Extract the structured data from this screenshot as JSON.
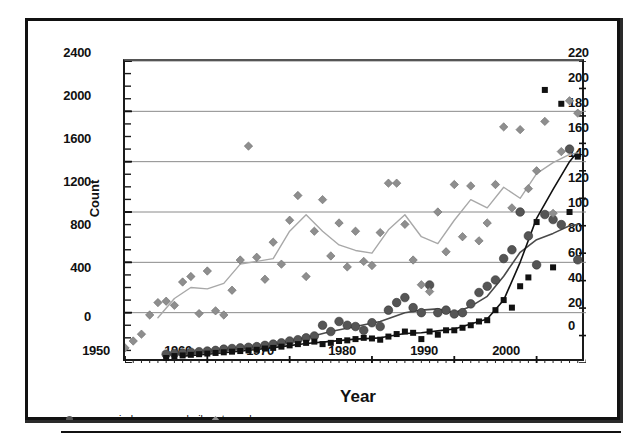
{
  "chart_data": {
    "type": "scatter",
    "title": "",
    "xlabel": "Year",
    "ylabel": "Count",
    "ylabel_secondary": "Tornadoes",
    "xlim": [
      1950,
      2006
    ],
    "ylim": [
      0,
      2400
    ],
    "ylim_secondary": [
      0,
      220
    ],
    "grid": true,
    "legend_position": "below-plot-left",
    "xticks": [
      1950,
      1960,
      1970,
      1980,
      1990,
      2000
    ],
    "yticks_left": [
      0,
      400,
      800,
      1200,
      1600,
      2000,
      2400
    ],
    "yticks_right": [
      0,
      20,
      40,
      60,
      80,
      100,
      120,
      140,
      160,
      180,
      200,
      220
    ],
    "minor_tick_interval_left": 100,
    "legend": [
      {
        "label": "severe wind",
        "marker": "circle",
        "color": "#555555"
      },
      {
        "label": "severe hail",
        "marker": "square",
        "color": "#111111"
      },
      {
        "label": "tornadoes",
        "marker": "diamond",
        "color": "#8e8e8e"
      }
    ],
    "series": [
      {
        "name": "severe wind",
        "marker": "circle",
        "axis": "left",
        "color": "#555555",
        "x": [
          1955,
          1956,
          1957,
          1958,
          1959,
          1960,
          1961,
          1962,
          1963,
          1964,
          1965,
          1966,
          1967,
          1968,
          1969,
          1970,
          1971,
          1972,
          1973,
          1974,
          1975,
          1976,
          1977,
          1978,
          1979,
          1980,
          1981,
          1982,
          1983,
          1984,
          1985,
          1986,
          1987,
          1988,
          1989,
          1990,
          1991,
          1992,
          1993,
          1994,
          1995,
          1996,
          1997,
          1998,
          1999,
          2000,
          2001,
          2002,
          2003,
          2004,
          2005
        ],
        "values": [
          70,
          75,
          80,
          85,
          90,
          95,
          100,
          110,
          115,
          120,
          125,
          130,
          140,
          150,
          160,
          175,
          185,
          200,
          215,
          300,
          250,
          330,
          300,
          290,
          260,
          320,
          290,
          420,
          480,
          520,
          440,
          400,
          620,
          400,
          420,
          390,
          400,
          470,
          560,
          610,
          660,
          830,
          900,
          1200,
          1010,
          780,
          1180,
          1140,
          1100,
          1700,
          820
        ]
      },
      {
        "name": "severe hail",
        "marker": "square",
        "axis": "left",
        "color": "#111111",
        "x": [
          1955,
          1956,
          1957,
          1958,
          1959,
          1960,
          1961,
          1962,
          1963,
          1964,
          1965,
          1966,
          1967,
          1968,
          1969,
          1970,
          1971,
          1972,
          1973,
          1974,
          1975,
          1976,
          1977,
          1978,
          1979,
          1980,
          1981,
          1982,
          1983,
          1984,
          1985,
          1986,
          1987,
          1988,
          1989,
          1990,
          1991,
          1992,
          1993,
          1994,
          1995,
          1996,
          1997,
          1998,
          1999,
          2000,
          2001,
          2002,
          2003,
          2004,
          2005
        ],
        "values": [
          40,
          55,
          60,
          65,
          70,
          75,
          80,
          85,
          90,
          95,
          100,
          105,
          115,
          120,
          130,
          140,
          150,
          160,
          170,
          150,
          160,
          175,
          180,
          190,
          200,
          195,
          185,
          210,
          230,
          250,
          240,
          190,
          250,
          225,
          260,
          260,
          280,
          300,
          330,
          340,
          420,
          500,
          440,
          610,
          680,
          1120,
          2170,
          760,
          2060,
          1200,
          1640
        ]
      },
      {
        "name": "tornadoes",
        "marker": "diamond",
        "axis": "right",
        "color": "#8e8e8e",
        "x": [
          1950,
          1951,
          1952,
          1953,
          1954,
          1955,
          1956,
          1957,
          1958,
          1959,
          1960,
          1961,
          1962,
          1963,
          1964,
          1965,
          1966,
          1967,
          1968,
          1969,
          1970,
          1971,
          1972,
          1973,
          1974,
          1975,
          1976,
          1977,
          1978,
          1979,
          1980,
          1981,
          1982,
          1983,
          1984,
          1985,
          1986,
          1987,
          1988,
          1989,
          1990,
          1991,
          1992,
          1993,
          1994,
          1995,
          1996,
          1997,
          1998,
          1999,
          2000,
          2001,
          2002,
          2003,
          2004,
          2005
        ],
        "values": [
          11,
          16,
          21,
          35,
          44,
          45,
          42,
          59,
          63,
          36,
          67,
          38,
          35,
          53,
          75,
          158,
          77,
          61,
          88,
          72,
          104,
          122,
          63,
          96,
          119,
          78,
          102,
          70,
          96,
          74,
          71,
          95,
          131,
          131,
          101,
          75,
          57,
          52,
          110,
          81,
          130,
          92,
          129,
          89,
          102,
          130,
          172,
          113,
          170,
          127,
          140,
          176,
          109,
          154,
          191,
          182
        ]
      },
      {
        "name": "severe wind trend",
        "marker": "line",
        "axis": "left",
        "color": "#4a4a4a",
        "x": [
          1957,
          1960,
          1963,
          1966,
          1969,
          1972,
          1975,
          1978,
          1981,
          1984,
          1986,
          1988,
          1990,
          1992,
          1994,
          1996,
          1998,
          2000,
          2002,
          2004,
          2005
        ],
        "values": [
          80,
          95,
          112,
          132,
          160,
          200,
          250,
          290,
          330,
          400,
          420,
          430,
          400,
          450,
          530,
          690,
          880,
          980,
          1030,
          1090,
          1100
        ]
      },
      {
        "name": "severe hail trend",
        "marker": "line",
        "axis": "left",
        "color": "#111111",
        "x": [
          1957,
          1960,
          1963,
          1966,
          1969,
          1972,
          1975,
          1978,
          1981,
          1984,
          1986,
          1988,
          1990,
          1992,
          1994,
          1996,
          1998,
          2000,
          2002,
          2004,
          2005
        ],
        "values": [
          55,
          70,
          88,
          108,
          130,
          155,
          172,
          190,
          200,
          235,
          240,
          255,
          270,
          310,
          350,
          500,
          800,
          1150,
          1380,
          1600,
          1680
        ]
      },
      {
        "name": "tornadoes trend",
        "marker": "line",
        "axis": "right",
        "color": "#a8a8a8",
        "x": [
          1954,
          1956,
          1958,
          1960,
          1962,
          1964,
          1966,
          1968,
          1970,
          1972,
          1974,
          1976,
          1978,
          1980,
          1982,
          1984,
          1986,
          1988,
          1990,
          1992,
          1994,
          1996,
          1998,
          2000,
          2002,
          2004,
          2005
        ],
        "values": [
          33,
          47,
          55,
          54,
          58,
          72,
          74,
          76,
          96,
          108,
          96,
          86,
          82,
          80,
          97,
          108,
          92,
          87,
          104,
          119,
          113,
          128,
          120,
          138,
          146,
          152,
          153
        ]
      }
    ]
  },
  "axes": {
    "left_title": "Count",
    "right_title": "Tornadoes",
    "bottom_title": "Year"
  }
}
